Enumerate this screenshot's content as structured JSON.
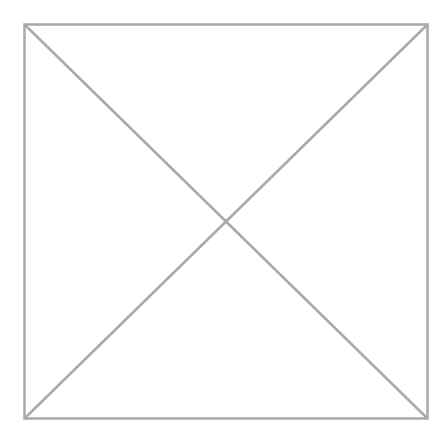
{
  "placeholder": {
    "type": "image-placeholder",
    "icon": "crossed-box-icon",
    "stroke_color": "#a9a9a9",
    "background_color": "#ffffff",
    "stroke_width": 2.5
  }
}
